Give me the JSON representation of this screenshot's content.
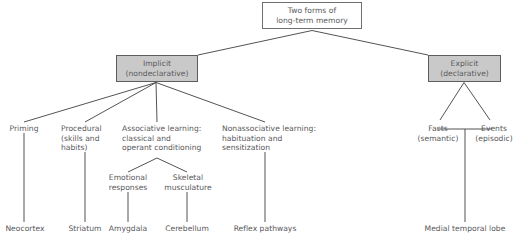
{
  "diagram": {
    "type": "hierarchy-tree",
    "title_node": {
      "id": "root",
      "label": "Two forms of\nlong-term memory",
      "style": "boxed",
      "fill": "#ffffff"
    },
    "colors": {
      "text": "#58585a",
      "line": "#3f3f41",
      "box_border": "#6f6f72",
      "shaded_fill": "#c9c9c9",
      "background": "#ffffff"
    },
    "level2": [
      {
        "id": "implicit",
        "label": "Implicit\n(nondeclarative)",
        "style": "boxed-shaded",
        "fill": "#c9c9c9"
      },
      {
        "id": "explicit",
        "label": "Explicit\n(declarative)",
        "style": "boxed-shaded",
        "fill": "#c9c9c9"
      }
    ],
    "implicit_children": [
      {
        "id": "priming",
        "label": "Priming"
      },
      {
        "id": "procedural",
        "label": "Procedural\n(skills and\nhabits)"
      },
      {
        "id": "associative",
        "label": "Associative learning:\nclassical and\noperant conditioning"
      },
      {
        "id": "nonassociative",
        "label": "Nonassociative learning:\nhabituation and\nsensitization"
      }
    ],
    "associative_children": [
      {
        "id": "emotional",
        "label": "Emotional\nresponses"
      },
      {
        "id": "skeletal",
        "label": "Skeletal\nmusculature"
      }
    ],
    "explicit_children": [
      {
        "id": "facts",
        "label": "Facts\n(semantic)"
      },
      {
        "id": "events",
        "label": "Events\n(episodic)"
      }
    ],
    "brain_structures": [
      {
        "id": "neocortex",
        "label": "Neocortex"
      },
      {
        "id": "striatum",
        "label": "Striatum"
      },
      {
        "id": "amygdala",
        "label": "Amygdala"
      },
      {
        "id": "cerebellum",
        "label": "Cerebellum"
      },
      {
        "id": "reflex",
        "label": "Reflex pathways"
      },
      {
        "id": "medial",
        "label": "Medial temporal lobe"
      }
    ]
  }
}
